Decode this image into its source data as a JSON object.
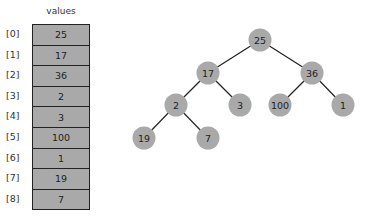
{
  "array": {
    "title": "values",
    "cells": [
      {
        "index": "[0]",
        "value": "25"
      },
      {
        "index": "[1]",
        "value": "17"
      },
      {
        "index": "[2]",
        "value": "36"
      },
      {
        "index": "[3]",
        "value": "2"
      },
      {
        "index": "[4]",
        "value": "3"
      },
      {
        "index": "[5]",
        "value": "100"
      },
      {
        "index": "[6]",
        "value": "1"
      },
      {
        "index": "[7]",
        "value": "19"
      },
      {
        "index": "[8]",
        "value": "7"
      }
    ]
  },
  "tree": {
    "nodes": [
      {
        "id": 0,
        "value": "25",
        "x": 260,
        "y": 40
      },
      {
        "id": 1,
        "value": "17",
        "x": 208,
        "y": 73
      },
      {
        "id": 2,
        "value": "36",
        "x": 312,
        "y": 73
      },
      {
        "id": 3,
        "value": "2",
        "x": 176,
        "y": 105
      },
      {
        "id": 4,
        "value": "3",
        "x": 240,
        "y": 105
      },
      {
        "id": 5,
        "value": "100",
        "x": 280,
        "y": 105
      },
      {
        "id": 6,
        "value": "1",
        "x": 343,
        "y": 105
      },
      {
        "id": 7,
        "value": "19",
        "x": 144,
        "y": 138
      },
      {
        "id": 8,
        "value": "7",
        "x": 208,
        "y": 138
      }
    ],
    "edges": [
      [
        0,
        1
      ],
      [
        0,
        2
      ],
      [
        1,
        3
      ],
      [
        1,
        4
      ],
      [
        2,
        5
      ],
      [
        2,
        6
      ],
      [
        3,
        7
      ],
      [
        3,
        8
      ]
    ]
  },
  "colors": {
    "node_fill": "#a9a9a9",
    "cell_fill": "#a9a9a9",
    "edge": "#222222"
  }
}
